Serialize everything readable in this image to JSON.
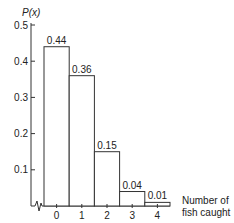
{
  "chart_data": {
    "type": "bar",
    "title": "",
    "xlabel": "Number of fish caught",
    "xlabel_lines": [
      "Number of",
      "fish caught"
    ],
    "ylabel": "P(x)",
    "categories": [
      "0",
      "1",
      "2",
      "3",
      "4"
    ],
    "values": [
      0.44,
      0.36,
      0.15,
      0.04,
      0.01
    ],
    "value_labels": [
      "0.44",
      "0.36",
      "0.15",
      "0.04",
      "0.01"
    ],
    "ylim": [
      0,
      0.5
    ],
    "yticks": [
      0.1,
      0.2,
      0.3,
      0.4,
      0.5
    ],
    "ytick_labels": [
      "0.1",
      "0.2",
      "0.3",
      "0.4",
      "0.5"
    ],
    "grid": false,
    "legend": null,
    "axis_break": true,
    "bar_fill": "#ffffff",
    "bar_stroke": "#333333"
  }
}
